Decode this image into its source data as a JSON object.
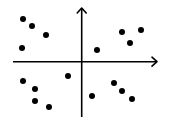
{
  "chart_data": {
    "type": "scatter",
    "title": "",
    "xlabel": "",
    "ylabel": "",
    "grid": false,
    "legend": null,
    "axes": {
      "style": "cartesian-cross-with-arrows",
      "origin_px": [
        81.7,
        61.7
      ],
      "x_axis_px": {
        "from": 13,
        "to": 157,
        "y": 61.7,
        "arrow": "right"
      },
      "y_axis_px": {
        "x": 81.7,
        "from": 117,
        "to": 8,
        "arrow": "up"
      },
      "tick_labels": false
    },
    "xlim": [
      -69,
      76
    ],
    "ylim": [
      -56,
      54
    ],
    "color": "#000000",
    "marker_radius": 3,
    "series": [
      {
        "name": "quadrant-II",
        "points": [
          {
            "x": -58.7,
            "y": 42.7
          },
          {
            "x": -49.7,
            "y": 35.7
          },
          {
            "x": -35.7,
            "y": 26.7
          },
          {
            "x": -59.7,
            "y": 13.7
          }
        ]
      },
      {
        "name": "quadrant-I",
        "points": [
          {
            "x": 15.3,
            "y": 11.7
          },
          {
            "x": 40.3,
            "y": 29.7
          },
          {
            "x": 59.3,
            "y": 31.7
          },
          {
            "x": 48.3,
            "y": 18.7
          }
        ]
      },
      {
        "name": "quadrant-III",
        "points": [
          {
            "x": -58.7,
            "y": -19.3
          },
          {
            "x": -46.7,
            "y": -27.3
          },
          {
            "x": -46.7,
            "y": -39.3
          },
          {
            "x": -32.7,
            "y": -45.3
          },
          {
            "x": -13.7,
            "y": -14.3
          }
        ]
      },
      {
        "name": "quadrant-IV",
        "points": [
          {
            "x": 10.3,
            "y": -34.3
          },
          {
            "x": 32.3,
            "y": -21.3
          },
          {
            "x": 40.3,
            "y": -29.3
          },
          {
            "x": 50.3,
            "y": -37.3
          }
        ]
      }
    ]
  }
}
